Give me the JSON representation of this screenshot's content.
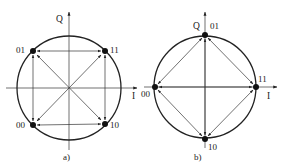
{
  "diagram_a": {
    "caption": "a)",
    "axis_q": "Q",
    "axis_i": "I",
    "points": [
      {
        "label": "01",
        "x": 33,
        "y": 51
      },
      {
        "label": "11",
        "x": 105,
        "y": 51
      },
      {
        "label": "00",
        "x": 33,
        "y": 125
      },
      {
        "label": "10",
        "x": 105,
        "y": 124
      }
    ],
    "transitions": "all pairs: horizontal, vertical and diagonal double-headed arrows"
  },
  "diagram_b": {
    "caption": "b)",
    "axis_q": "Q",
    "axis_i": "I",
    "points": [
      {
        "label": "01",
        "x": 205,
        "y": 35
      },
      {
        "label": "11",
        "x": 256,
        "y": 87
      },
      {
        "label": "00",
        "x": 155,
        "y": 87
      },
      {
        "label": "10",
        "x": 205,
        "y": 139
      }
    ],
    "transitions": "all pairs: adjacent chords and axis-through double-headed arrows"
  },
  "colors": {
    "stroke": "#222222",
    "background": "#ffffff"
  }
}
